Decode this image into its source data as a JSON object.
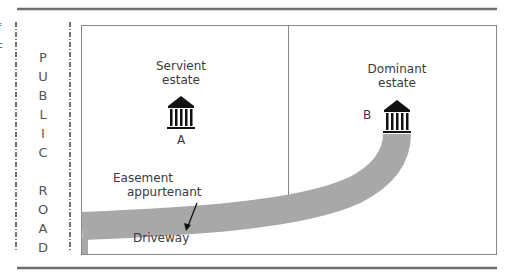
{
  "diagram": {
    "road_label_letters": [
      "P",
      "U",
      "B",
      "L",
      "I",
      "C",
      "",
      "R",
      "O",
      "A",
      "D"
    ],
    "road_label": "PUBLIC ROAD",
    "servient": {
      "line1": "Servient",
      "line2": "estate",
      "marker": "A"
    },
    "dominant": {
      "line1": "Dominant",
      "line2": "estate",
      "marker": "B"
    },
    "easement": {
      "line1": "Easement",
      "line2": "appurtenant"
    },
    "driveway_label": "Driveway",
    "edge_fragments": [
      "f",
      "c"
    ],
    "colors": {
      "driveway": "#a8a8a8",
      "frame": "#888888",
      "rule": "#6e6e6e",
      "icon": "#111111"
    }
  }
}
